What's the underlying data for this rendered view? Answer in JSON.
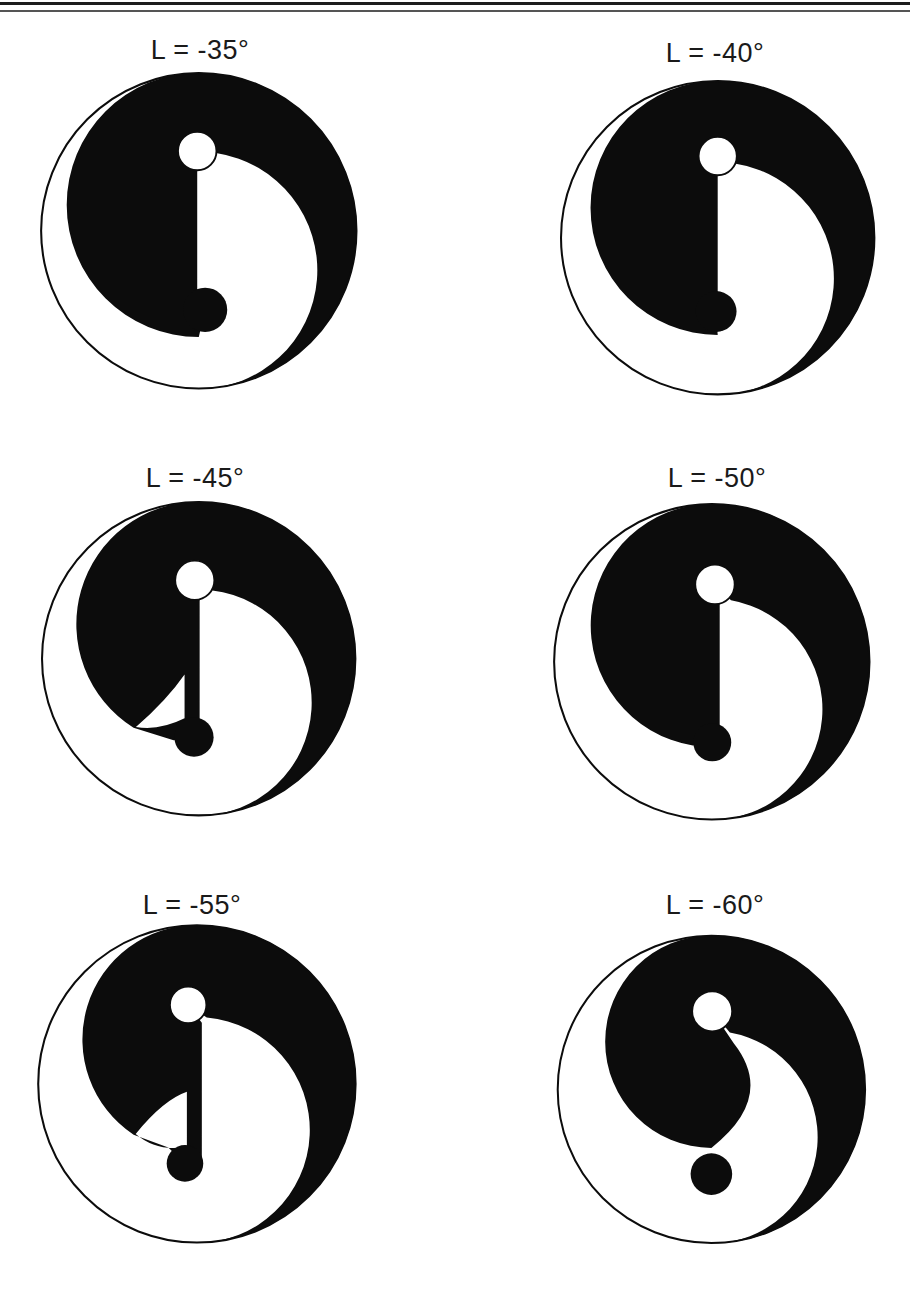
{
  "page": {
    "background": "#ffffff",
    "header_rules": [
      {
        "y": 2,
        "h": 3,
        "color": "#1c1c1c"
      },
      {
        "y": 10,
        "h": 2,
        "color": "#555555"
      }
    ]
  },
  "figure": {
    "ink": "#0c0c0c",
    "paper": "#ffffff",
    "outer_stroke_w": 0.013,
    "nodus_stroke_w": 0.012
  },
  "panels": [
    {
      "label": "L = -35°",
      "latitude_deg": -35,
      "cx": 199,
      "cy": 231,
      "r": 158,
      "label_cx": 200,
      "label_cy": 50,
      "geom": {
        "rL": 0.836,
        "rR": 0.75,
        "thetaW": -81,
        "white": {
          "x": -0.01,
          "y": -0.505,
          "r": 0.122
        },
        "dot": {
          "x": 0.04,
          "y": 0.5,
          "r": 0.14
        },
        "inner": [
          [
            -0.01,
            -0.383
          ],
          [
            -0.01,
            0.5
          ],
          [
            0.04,
            0.5
          ],
          [
            0.0,
            0.672
          ]
        ],
        "innerQ": null,
        "hole": null
      }
    },
    {
      "label": "L = -40°",
      "latitude_deg": -40,
      "cx": 718,
      "cy": 238,
      "r": 157,
      "label_cx": 715,
      "label_cy": 53,
      "geom": {
        "rL": 0.81,
        "rR": 0.74,
        "thetaW": -81,
        "white": {
          "x": 0.0,
          "y": -0.52,
          "r": 0.122
        },
        "dot": {
          "x": -0.01,
          "y": 0.47,
          "r": 0.13
        },
        "inner": [
          [
            0.0,
            -0.398
          ],
          [
            0.0,
            0.47
          ],
          [
            -0.01,
            0.47
          ],
          [
            0.0,
            0.62
          ]
        ],
        "innerQ": null,
        "hole": null
      }
    },
    {
      "label": "L = -45°",
      "latitude_deg": -45,
      "cx": 199,
      "cy": 659,
      "r": 157,
      "label_cx": 195,
      "label_cy": 478,
      "geom": {
        "rL": 0.78,
        "rR": 0.72,
        "thetaW": -83,
        "white": {
          "x": -0.025,
          "y": -0.5,
          "r": 0.125
        },
        "dot": {
          "x": -0.03,
          "y": 0.5,
          "r": 0.125
        },
        "inner": [
          [
            0.006,
            -0.375
          ],
          [
            0.006,
            0.5
          ],
          [
            -0.03,
            0.5
          ],
          [
            -0.16,
            0.52
          ],
          [
            -0.415,
            0.44
          ]
        ],
        "innerQ": null,
        "hole": {
          "pinch": [
            -0.4,
            0.435
          ],
          "c1": [
            -0.2,
            0.26
          ],
          "p1": [
            -0.09,
            0.1
          ],
          "p2": [
            -0.09,
            0.38
          ],
          "c2": [
            -0.25,
            0.46
          ]
        }
      }
    },
    {
      "label": "L = -50°",
      "latitude_deg": -50,
      "cx": 712,
      "cy": 662,
      "r": 158,
      "label_cx": 717,
      "label_cy": 478,
      "geom": {
        "rL": 0.77,
        "rR": 0.7,
        "thetaW": -80,
        "white": {
          "x": 0.02,
          "y": -0.49,
          "r": 0.125
        },
        "dot": {
          "x": 0.003,
          "y": 0.51,
          "r": 0.12
        },
        "inner": [
          [
            0.05,
            -0.365
          ],
          [
            0.05,
            0.51
          ],
          [
            0.003,
            0.51
          ],
          [
            -0.12,
            0.53
          ]
        ],
        "innerQ": null,
        "hole": null
      }
    },
    {
      "label": "L = -55°",
      "latitude_deg": -55,
      "cx": 197,
      "cy": 1084,
      "r": 159,
      "label_cx": 192,
      "label_cy": 905,
      "geom": {
        "rL": 0.72,
        "rR": 0.71,
        "thetaW": -85,
        "white": {
          "x": -0.055,
          "y": -0.497,
          "r": 0.115
        },
        "dot": {
          "x": -0.075,
          "y": 0.5,
          "r": 0.115
        },
        "inner": [
          [
            0.031,
            -0.385
          ],
          [
            0.031,
            0.5
          ],
          [
            -0.075,
            0.5
          ],
          [
            -0.18,
            0.4
          ],
          [
            -0.398,
            0.32
          ]
        ],
        "innerQ": null,
        "hole": {
          "pinch": [
            -0.385,
            0.315
          ],
          "c1": [
            -0.21,
            0.1
          ],
          "p1": [
            -0.063,
            0.05
          ],
          "p2": [
            -0.063,
            0.395
          ],
          "c2": [
            -0.25,
            0.43
          ]
        }
      }
    },
    {
      "label": "L = -60°",
      "latitude_deg": -60,
      "cx": 711,
      "cy": 1089,
      "r": 154,
      "label_cx": 715,
      "label_cy": 905,
      "geom": {
        "rL": 0.69,
        "rR": 0.69,
        "thetaW": -80,
        "white": {
          "x": 0.005,
          "y": -0.507,
          "r": 0.13
        },
        "dot": {
          "x": 0.0,
          "y": 0.55,
          "r": 0.135
        },
        "inner": [
          [
            0.145,
            -0.3
          ]
        ],
        "innerQ": {
          "c": [
            0.42,
            0.05
          ],
          "end": [
            0.0,
            0.38
          ]
        },
        "hole": null
      }
    }
  ]
}
